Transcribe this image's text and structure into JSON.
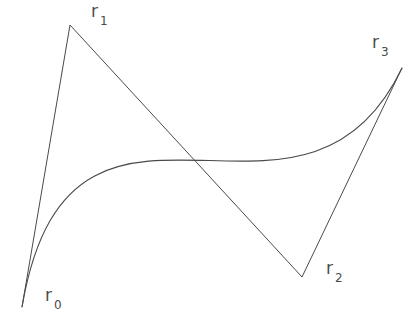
{
  "figure": {
    "background_color": "#ffffff",
    "stroke_color": "#4a4a4a",
    "width": 414,
    "height": 330
  },
  "chart_data": {
    "type": "line",
    "title": "",
    "subtitle": "",
    "xlabel": "",
    "ylabel": "",
    "xlim": [
      0,
      414
    ],
    "ylim": [
      330,
      0
    ],
    "grid": false,
    "legend": null,
    "series": [
      {
        "name": "control polygon",
        "type": "polyline",
        "points": [
          [
            22,
            307
          ],
          [
            70,
            25
          ],
          [
            302,
            277
          ],
          [
            402,
            68
          ]
        ]
      },
      {
        "name": "cubic bezier curve",
        "type": "cubic-bezier",
        "start": [
          22,
          307
        ],
        "control1": [
          70,
          25
        ],
        "control2": [
          302,
          277
        ],
        "end": [
          402,
          68
        ],
        "path": "M 22 307 C 70 25 302 277 402 68"
      }
    ],
    "annotations": [
      {
        "id": "r0",
        "base": "r",
        "subscript": "0",
        "point": [
          22,
          307
        ],
        "label_position": [
          45,
          287
        ]
      },
      {
        "id": "r1",
        "base": "r",
        "subscript": "1",
        "point": [
          70,
          25
        ],
        "label_position": [
          91,
          3
        ]
      },
      {
        "id": "r2",
        "base": "r",
        "subscript": "2",
        "point": [
          302,
          277
        ],
        "label_position": [
          326,
          260
        ]
      },
      {
        "id": "r3",
        "base": "r",
        "subscript": "3",
        "point": [
          402,
          68
        ],
        "label_position": [
          372,
          34
        ]
      }
    ]
  },
  "labels": {
    "r0": {
      "base": "r",
      "sub": "0"
    },
    "r1": {
      "base": "r",
      "sub": "1"
    },
    "r2": {
      "base": "r",
      "sub": "2"
    },
    "r3": {
      "base": "r",
      "sub": "3"
    }
  }
}
